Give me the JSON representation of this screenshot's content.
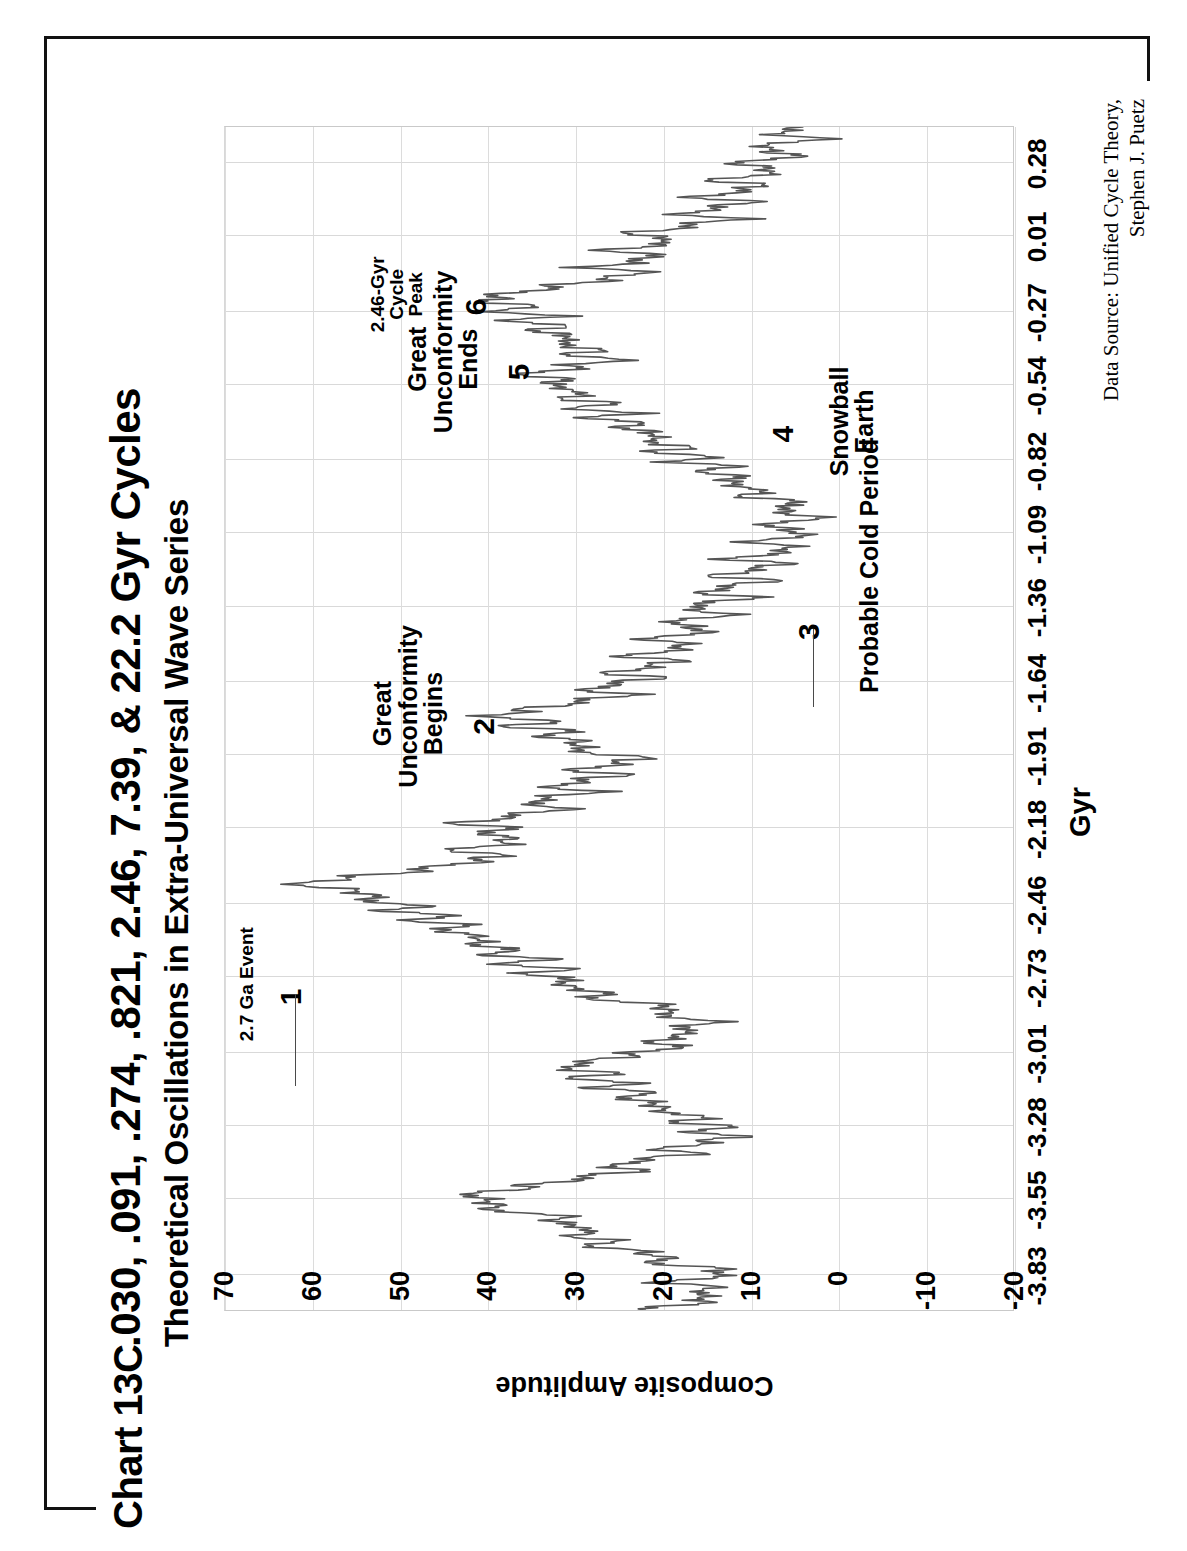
{
  "chart_id": "Chart 13C",
  "title_line1": ".030, .091, .274, .821, 2.46, 7.39, & 22.2 Gyr Cycles",
  "title_line2": "Theoretical Oscillations in Extra-Universal Wave Series",
  "source_line1": "Data Source:  Unified Cycle Theory,",
  "source_line2": "Stephen J. Puetz",
  "chart_data": {
    "type": "line",
    "title": ".030, .091, .274, .821, 2.46, 7.39, & 22.2 Gyr Cycles",
    "subtitle": "Theoretical Oscillations in Extra-Universal Wave Series",
    "xlabel": "Gyr",
    "ylabel": "Composite Amplitude",
    "xlim": [
      -3.96,
      0.42
    ],
    "ylim": [
      -20,
      70
    ],
    "grid": true,
    "legend": "none",
    "line_color": "#555555",
    "xticks": [
      "-3.83",
      "-3.55",
      "-3.28",
      "-3.01",
      "-2.73",
      "-2.46",
      "-2.18",
      "-1.91",
      "-1.64",
      "-1.36",
      "-1.09",
      "-0.82",
      "-0.54",
      "-0.27",
      "0.01",
      "0.28"
    ],
    "xtick_values": [
      -3.83,
      -3.55,
      -3.28,
      -3.01,
      -2.73,
      -2.46,
      -2.18,
      -1.91,
      -1.64,
      -1.36,
      -1.09,
      -0.82,
      -0.54,
      -0.27,
      0.01,
      0.28
    ],
    "yticks": [
      "70",
      "60",
      "50",
      "40",
      "30",
      "20",
      "10",
      "0",
      "-10",
      "-20"
    ],
    "ytick_values": [
      70,
      60,
      50,
      40,
      30,
      20,
      10,
      0,
      -10,
      -20
    ],
    "annotations": [
      {
        "id": "a1",
        "label": "2.7 Ga Event",
        "number": "1",
        "x": -2.8,
        "y": 62
      },
      {
        "id": "a2",
        "label": "Great\nUnconformity\nBegins",
        "number": "2",
        "x": -1.8,
        "y": 40
      },
      {
        "id": "a3",
        "label": "Probable Cold Period",
        "number": "3",
        "x": -1.45,
        "y": 3
      },
      {
        "id": "a4",
        "label": "Snowball\nEarth",
        "number": "4",
        "x": -0.72,
        "y": 6
      },
      {
        "id": "a5",
        "label": "Great\nUnconformity\nEnds",
        "number": "5",
        "x": -0.49,
        "y": 36
      },
      {
        "id": "a6",
        "label": "2.46-Gyr\nCycle\nPeak",
        "number": "6",
        "x": -0.25,
        "y": 41
      }
    ],
    "x": [
      -3.96,
      -3.94,
      -3.92,
      -3.9,
      -3.88,
      -3.86,
      -3.84,
      -3.82,
      -3.8,
      -3.78,
      -3.76,
      -3.74,
      -3.72,
      -3.7,
      -3.68,
      -3.66,
      -3.64,
      -3.62,
      -3.6,
      -3.58,
      -3.56,
      -3.54,
      -3.52,
      -3.5,
      -3.48,
      -3.46,
      -3.44,
      -3.42,
      -3.4,
      -3.38,
      -3.36,
      -3.34,
      -3.32,
      -3.3,
      -3.28,
      -3.26,
      -3.24,
      -3.22,
      -3.2,
      -3.18,
      -3.16,
      -3.14,
      -3.12,
      -3.1,
      -3.08,
      -3.06,
      -3.04,
      -3.02,
      -3.0,
      -2.98,
      -2.96,
      -2.94,
      -2.92,
      -2.9,
      -2.88,
      -2.86,
      -2.84,
      -2.82,
      -2.8,
      -2.78,
      -2.76,
      -2.74,
      -2.72,
      -2.7,
      -2.68,
      -2.66,
      -2.64,
      -2.62,
      -2.6,
      -2.58,
      -2.56,
      -2.54,
      -2.52,
      -2.5,
      -2.48,
      -2.46,
      -2.44,
      -2.42,
      -2.4,
      -2.38,
      -2.36,
      -2.34,
      -2.32,
      -2.3,
      -2.28,
      -2.26,
      -2.24,
      -2.22,
      -2.2,
      -2.18,
      -2.16,
      -2.14,
      -2.12,
      -2.1,
      -2.08,
      -2.06,
      -2.04,
      -2.02,
      -2.0,
      -1.98,
      -1.96,
      -1.94,
      -1.92,
      -1.9,
      -1.88,
      -1.86,
      -1.84,
      -1.82,
      -1.8,
      -1.78,
      -1.76,
      -1.74,
      -1.72,
      -1.7,
      -1.68,
      -1.66,
      -1.64,
      -1.62,
      -1.6,
      -1.58,
      -1.56,
      -1.54,
      -1.52,
      -1.5,
      -1.48,
      -1.46,
      -1.44,
      -1.42,
      -1.4,
      -1.38,
      -1.36,
      -1.34,
      -1.32,
      -1.3,
      -1.28,
      -1.26,
      -1.24,
      -1.22,
      -1.2,
      -1.18,
      -1.16,
      -1.14,
      -1.12,
      -1.1,
      -1.08,
      -1.06,
      -1.04,
      -1.02,
      -1.0,
      -0.98,
      -0.96,
      -0.94,
      -0.92,
      -0.9,
      -0.88,
      -0.86,
      -0.84,
      -0.82,
      -0.8,
      -0.78,
      -0.76,
      -0.74,
      -0.72,
      -0.7,
      -0.68,
      -0.66,
      -0.64,
      -0.62,
      -0.6,
      -0.58,
      -0.56,
      -0.54,
      -0.52,
      -0.5,
      -0.48,
      -0.46,
      -0.44,
      -0.42,
      -0.4,
      -0.38,
      -0.36,
      -0.34,
      -0.32,
      -0.3,
      -0.28,
      -0.26,
      -0.24,
      -0.22,
      -0.2,
      -0.18,
      -0.16,
      -0.14,
      -0.12,
      -0.1,
      -0.08,
      -0.06,
      -0.04,
      -0.02,
      0.0,
      0.02,
      0.04,
      0.06,
      0.08,
      0.1,
      0.12,
      0.14,
      0.16,
      0.18,
      0.2,
      0.22,
      0.24,
      0.26,
      0.28,
      0.3,
      0.32,
      0.34,
      0.36,
      0.38,
      0.4,
      0.42
    ],
    "y": [
      22,
      18,
      14,
      17,
      13,
      20,
      15,
      12,
      16,
      22,
      19,
      24,
      28,
      26,
      31,
      27,
      33,
      30,
      36,
      41,
      38,
      43,
      39,
      35,
      31,
      27,
      23,
      26,
      21,
      17,
      20,
      15,
      12,
      16,
      13,
      18,
      15,
      22,
      19,
      25,
      21,
      27,
      24,
      30,
      26,
      32,
      28,
      25,
      21,
      18,
      22,
      16,
      19,
      14,
      17,
      21,
      18,
      24,
      29,
      26,
      33,
      29,
      36,
      31,
      38,
      34,
      40,
      37,
      43,
      39,
      46,
      42,
      48,
      45,
      51,
      48,
      55,
      52,
      58,
      62,
      56,
      50,
      46,
      42,
      38,
      44,
      40,
      36,
      41,
      37,
      43,
      39,
      35,
      31,
      36,
      32,
      28,
      33,
      29,
      25,
      30,
      26,
      22,
      27,
      31,
      28,
      34,
      30,
      37,
      33,
      40,
      36,
      32,
      28,
      24,
      29,
      25,
      21,
      26,
      22,
      18,
      24,
      20,
      16,
      22,
      18,
      14,
      20,
      16,
      12,
      18,
      14,
      10,
      16,
      12,
      8,
      14,
      10,
      6,
      12,
      8,
      4,
      10,
      6,
      3,
      9,
      5,
      2,
      8,
      4,
      7,
      11,
      8,
      14,
      10,
      16,
      12,
      18,
      15,
      21,
      17,
      23,
      19,
      25,
      22,
      28,
      24,
      30,
      26,
      32,
      28,
      34,
      30,
      36,
      32,
      29,
      25,
      31,
      27,
      33,
      29,
      35,
      31,
      37,
      33,
      39,
      35,
      41,
      38,
      34,
      30,
      26,
      22,
      28,
      24,
      20,
      26,
      22,
      18,
      24,
      20,
      16,
      12,
      18,
      14,
      10,
      16,
      12,
      8,
      14,
      10,
      6,
      12,
      8,
      4,
      10,
      6,
      2,
      8,
      4,
      0,
      6,
      2,
      -2,
      4,
      0,
      -4,
      2,
      -2,
      -6,
      0,
      -4,
      -8,
      -2,
      -6,
      -10,
      -4,
      -8,
      -12,
      -6,
      -10,
      -14
    ]
  }
}
